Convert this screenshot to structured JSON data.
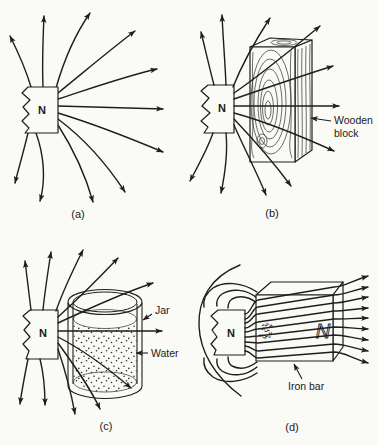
{
  "colors": {
    "ink": "#1e1e1e",
    "paper": "#fafaf6"
  },
  "panels": {
    "a": {
      "caption": "(a)",
      "pole_label": "N"
    },
    "b": {
      "caption": "(b)",
      "pole_label": "N",
      "block_label_line1": "Wooden",
      "block_label_line2": "block"
    },
    "c": {
      "caption": "(c)",
      "pole_label": "N",
      "jar_label": "Jar",
      "water_label": "Water"
    },
    "d": {
      "caption": "(d)",
      "pole_label": "N",
      "induced_pole_left": "S",
      "induced_pole_right": "N",
      "bar_label": "Iron bar"
    }
  }
}
